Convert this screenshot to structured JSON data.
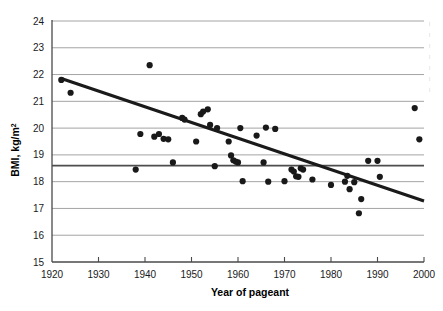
{
  "chart_data": {
    "type": "scatter",
    "title": "",
    "xlabel": "Year of pageant",
    "ylabel": "BMI, kg/m",
    "ylabel_sup": "2",
    "xlim": [
      1920,
      2000
    ],
    "ylim": [
      15,
      24
    ],
    "xticks": [
      1920,
      1930,
      1940,
      1950,
      1960,
      1970,
      1980,
      1990,
      2000
    ],
    "yticks": [
      15,
      16,
      17,
      18,
      19,
      20,
      21,
      22,
      23,
      24
    ],
    "grid": "horizontal",
    "legend": "none",
    "point_color": "#191919",
    "trendline_color": "#1a1a1a",
    "gridline_color": "#9a9a9a",
    "reference_line": {
      "y": 18.6,
      "color": "#4d4d4d",
      "label": ""
    },
    "trendline": {
      "type": "linear-fit",
      "x_start": 1922,
      "y_start": 21.85,
      "x_end": 2000,
      "y_end": 17.28
    },
    "x": [
      1922,
      1924,
      1938,
      1939,
      1941,
      1942,
      1943,
      1944,
      1945,
      1946,
      1948,
      1948.5,
      1951,
      1952,
      1952.5,
      1953.5,
      1954,
      1955,
      1955.5,
      1958,
      1958.5,
      1959,
      1959.5,
      1960,
      1960.5,
      1961,
      1964,
      1965.5,
      1966,
      1966.5,
      1968,
      1970,
      1971.5,
      1972,
      1972.5,
      1973,
      1973.5,
      1974,
      1976,
      1980,
      1983,
      1983.5,
      1984,
      1985,
      1986,
      1986.5,
      1988,
      1990,
      1990.5,
      1998,
      1999
    ],
    "y": [
      21.8,
      21.32,
      18.45,
      19.78,
      22.35,
      19.68,
      19.78,
      19.6,
      19.58,
      18.72,
      20.38,
      20.32,
      19.5,
      20.52,
      20.62,
      20.7,
      20.12,
      18.58,
      20.0,
      19.5,
      18.98,
      18.8,
      18.75,
      18.72,
      20.0,
      18.02,
      19.72,
      18.72,
      20.02,
      18.0,
      19.97,
      18.02,
      18.45,
      18.38,
      18.2,
      18.18,
      18.5,
      18.45,
      18.08,
      17.88,
      18.0,
      18.22,
      17.72,
      17.98,
      16.82,
      17.35,
      18.78,
      18.78,
      18.18,
      20.75,
      19.58
    ],
    "n_points": 51
  },
  "axes": {
    "y_axis_title": "BMI, kg/m",
    "y_axis_title_superscript": "2",
    "x_axis_title": "Year of pageant"
  },
  "edge_fragments": [
    "|",
    "|",
    "|",
    "|",
    "|",
    "|",
    "|"
  ]
}
